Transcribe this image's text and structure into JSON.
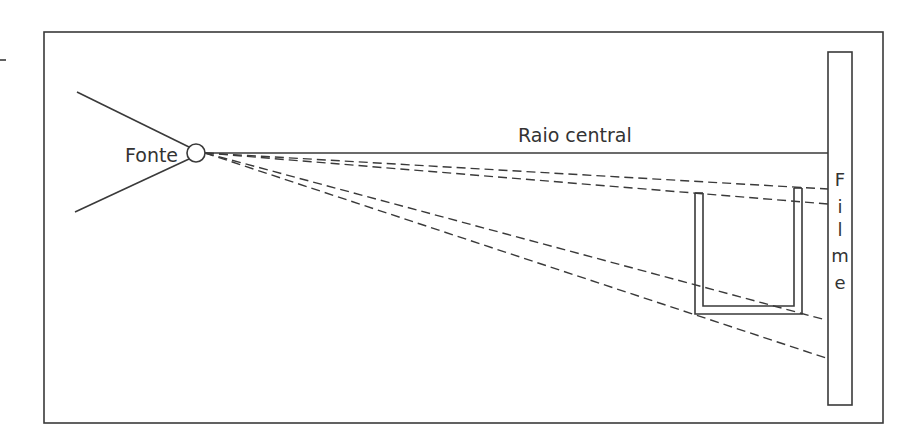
{
  "diagram": {
    "labels": {
      "source": "Fonte",
      "central_ray": "Raio central",
      "film_letters": [
        "F",
        "i",
        "l",
        "m",
        "e"
      ]
    },
    "elements": [
      {
        "name": "source",
        "kind": "point-source",
        "label": "Fonte"
      },
      {
        "name": "central-ray",
        "kind": "solid-ray",
        "label": "Raio central"
      },
      {
        "name": "object",
        "kind": "U-shaped object"
      },
      {
        "name": "film",
        "kind": "receptor",
        "label": "Filme"
      },
      {
        "name": "projection-rays",
        "kind": "dashed-rays",
        "count": 4
      }
    ],
    "colors": {
      "stroke": "#3a3a3a",
      "text": "#333333",
      "background": "#ffffff"
    }
  }
}
